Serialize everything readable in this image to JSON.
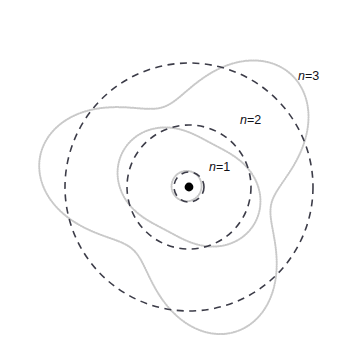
{
  "figure": {
    "width": 346,
    "height": 360,
    "background": "#ffffff",
    "nucleus": {
      "label": "nucleus",
      "cx": 189,
      "cy": 187,
      "r": 4.4,
      "color": "#000000"
    },
    "colors": {
      "orbit_dashed": "#3c3c48",
      "wave_dotted": "#c9c9c9",
      "label_text": "#111118"
    }
  },
  "labels": [
    {
      "id": "n1",
      "prefix": "n",
      "equals": "=",
      "value": "1",
      "text": "n=1",
      "x": 209,
      "y": 161
    },
    {
      "id": "n2",
      "prefix": "n",
      "equals": "=",
      "value": "2",
      "text": "n=2",
      "x": 240,
      "y": 114
    },
    {
      "id": "n3",
      "prefix": "n",
      "equals": "=",
      "value": "3",
      "text": "n=3",
      "x": 298,
      "y": 70
    }
  ],
  "chart_data": {
    "type": "line",
    "xlabel": "",
    "ylabel": "",
    "grid": false,
    "legend": "none",
    "center": [
      189,
      187
    ],
    "xlim": [
      0,
      346
    ],
    "ylim": [
      0,
      360
    ],
    "series": [
      {
        "name": "n=1 orbit",
        "kind": "circle",
        "style": "dashed",
        "color": "#3c3c48",
        "radius": 15,
        "center": [
          189,
          187
        ]
      },
      {
        "name": "n=1 standing wave",
        "kind": "rose-wave",
        "style": "dotted",
        "color": "#c9c9c9",
        "base_radius": 15,
        "amplitude": 2.6,
        "lobes": 1,
        "phase_deg": 200,
        "center": [
          189,
          187
        ]
      },
      {
        "name": "n=2 orbit",
        "kind": "circle",
        "style": "dashed",
        "color": "#3c3c48",
        "radius": 62,
        "center": [
          189,
          187
        ]
      },
      {
        "name": "n=2 standing wave",
        "kind": "rose-wave",
        "style": "dotted",
        "color": "#c9c9c9",
        "base_radius": 62,
        "amplitude": 13,
        "lobes": 2,
        "phase_deg": 28,
        "center": [
          189,
          187
        ]
      },
      {
        "name": "n=3 orbit",
        "kind": "circle",
        "style": "dashed",
        "color": "#3c3c48",
        "radius": 124,
        "center": [
          189,
          187
        ]
      },
      {
        "name": "n=3 standing wave",
        "kind": "rose-wave",
        "style": "dotted",
        "color": "#c9c9c9",
        "base_radius": 118,
        "amplitude": 34,
        "lobes": 3,
        "phase_deg": 72,
        "center": [
          189,
          187
        ]
      }
    ]
  }
}
